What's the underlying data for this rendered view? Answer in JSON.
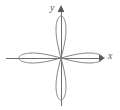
{
  "figure": {
    "name": "four-petaled-rose-polar-graph",
    "background_color": "#ffffff",
    "width": 120,
    "height": 110
  },
  "axes": {
    "x_label": "x",
    "y_label": "y",
    "axis_color": "#6e6f71",
    "axis_line_width": 1,
    "arrowheads": true,
    "origin": {
      "x": 61,
      "y": 58
    },
    "x_axis_start": {
      "x": 6,
      "y": 58
    },
    "x_axis_end": {
      "x": 104,
      "y": 58
    },
    "y_axis_start": {
      "x": 61,
      "y": 106
    },
    "y_axis_end": {
      "x": 61,
      "y": 6
    },
    "ticks": [],
    "tick_labels": [],
    "grid": false
  },
  "chart_data": {
    "type": "line",
    "title": "",
    "subtitle": "",
    "xlabel": "x",
    "ylabel": "y",
    "curve_name": "four-petaled rose",
    "polar_equation": "r = a cos(2θ)",
    "petal_count": 4,
    "petal_directions_deg": [
      0,
      90,
      180,
      270
    ],
    "petal_length_px": 42,
    "petal_half_width_px": 14,
    "curve_color": "#808184",
    "curve_line_width": 1,
    "legend": [],
    "annotations": [],
    "xlim": [
      -48,
      48
    ],
    "ylim": [
      -48,
      48
    ],
    "series": [
      {
        "name": "rose r = a cos(2θ)",
        "closed": true,
        "points_polar_deg_r": [
          [
            0,
            42
          ],
          [
            10,
            39.6
          ],
          [
            20,
            32.2
          ],
          [
            30,
            21.0
          ],
          [
            40,
            7.3
          ],
          [
            45,
            0
          ],
          [
            50,
            -7.3
          ],
          [
            60,
            -21.0
          ],
          [
            70,
            -32.2
          ],
          [
            80,
            -39.6
          ],
          [
            90,
            -42
          ],
          [
            100,
            -39.6
          ],
          [
            110,
            -32.2
          ],
          [
            120,
            -21.0
          ],
          [
            130,
            -7.3
          ],
          [
            135,
            0
          ],
          [
            140,
            7.3
          ],
          [
            150,
            21.0
          ],
          [
            160,
            32.2
          ],
          [
            170,
            39.6
          ],
          [
            180,
            42
          ],
          [
            190,
            39.6
          ],
          [
            200,
            32.2
          ],
          [
            210,
            21.0
          ],
          [
            220,
            7.3
          ],
          [
            225,
            0
          ],
          [
            230,
            -7.3
          ],
          [
            240,
            -21.0
          ],
          [
            250,
            -32.2
          ],
          [
            260,
            -39.6
          ],
          [
            270,
            -42
          ],
          [
            280,
            -39.6
          ],
          [
            290,
            -32.2
          ],
          [
            300,
            -21.0
          ],
          [
            310,
            -7.3
          ],
          [
            315,
            0
          ],
          [
            320,
            7.3
          ],
          [
            330,
            21.0
          ],
          [
            340,
            32.2
          ],
          [
            350,
            39.6
          ],
          [
            360,
            42
          ]
        ]
      }
    ]
  }
}
